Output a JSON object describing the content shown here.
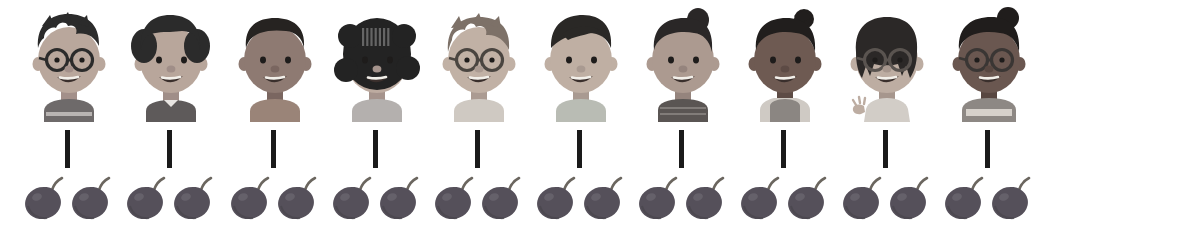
{
  "diagram": {
    "type": "pictorial-correspondence",
    "background_color": "#ffffff",
    "connector_color": "#1a1a1a",
    "groups_count": 10,
    "fruits_per_group": 2,
    "total_fruits": 20,
    "fruit_name": "plum",
    "fruit_color": "#55505a",
    "fruit_stem_color": "#6b665f",
    "columns": [
      {
        "index": 1,
        "x": 16,
        "child": {
          "name": "boy-with-glasses",
          "label": "Boy with round glasses",
          "skin": "#b9a79c",
          "skin_shadow": "#a3908a",
          "hair": "#2b2b2b",
          "hair_style": "spiky-short",
          "shirt": "#6e6a6a",
          "shirt_stripe": "#b8b4b2",
          "glasses": true,
          "glasses_color": "#2b2b2b",
          "accessory": "none"
        },
        "fruits": 2
      },
      {
        "index": 2,
        "x": 118,
        "child": {
          "name": "girl-with-pigtails",
          "label": "Girl with pigtails",
          "skin": "#b8a69b",
          "skin_shadow": "#a08e88",
          "hair": "#2b2b2b",
          "hair_style": "pigtails-bangs",
          "shirt": "#5e5a5a",
          "shirt_stripe": "#5e5a5a",
          "glasses": false,
          "glasses_color": "#2b2b2b",
          "accessory": "collar"
        },
        "fruits": 2
      },
      {
        "index": 3,
        "x": 222,
        "child": {
          "name": "boy-short-hair",
          "label": "Boy with short hair",
          "skin": "#8e7a72",
          "skin_shadow": "#7a6660",
          "hair": "#262321",
          "hair_style": "short-cropped",
          "shirt": "#9a8478",
          "shirt_stripe": "#9a8478",
          "glasses": false,
          "glasses_color": "#2b2b2b",
          "accessory": "none"
        },
        "fruits": 2
      },
      {
        "index": 4,
        "x": 324,
        "child": {
          "name": "girl-curly-bob",
          "label": "Girl with curly bob hair",
          "skin": "#bdaba0",
          "skin_shadow": "#a5938c",
          "hair": "#232323",
          "hair_style": "curly-bob-bangs",
          "shirt": "#b4b0ae",
          "shirt_stripe": "#b4b0ae",
          "glasses": false,
          "glasses_color": "#2b2b2b",
          "accessory": "none"
        },
        "fruits": 2
      },
      {
        "index": 5,
        "x": 426,
        "child": {
          "name": "boy-light-hair-glasses",
          "label": "Boy with light spiky hair and glasses",
          "skin": "#c1b1a5",
          "skin_shadow": "#ab9b92",
          "hair": "#7d7168",
          "hair_style": "spiky-light",
          "shirt": "#cfc9c2",
          "shirt_stripe": "#cfc9c2",
          "glasses": true,
          "glasses_color": "#4a4540",
          "accessory": "none"
        },
        "fruits": 2
      },
      {
        "index": 6,
        "x": 528,
        "child": {
          "name": "boy-side-swept-hair",
          "label": "Boy with side-swept dark hair",
          "skin": "#bfafa3",
          "skin_shadow": "#a99a91",
          "hair": "#2a2826",
          "hair_style": "side-swept",
          "shirt": "#b9bcb4",
          "shirt_stripe": "#b9bcb4",
          "glasses": false,
          "glasses_color": "#2b2b2b",
          "accessory": "none"
        },
        "fruits": 2
      },
      {
        "index": 7,
        "x": 630,
        "child": {
          "name": "girl-topknot",
          "label": "Girl with top knot",
          "skin": "#ac9a90",
          "skin_shadow": "#95847d",
          "hair": "#2a2727",
          "hair_style": "topknot-bangs",
          "shirt": "#5a5553",
          "shirt_stripe": "#8b8683",
          "glasses": false,
          "glasses_color": "#2b2b2b",
          "accessory": "knit-top"
        },
        "fruits": 2
      },
      {
        "index": 8,
        "x": 732,
        "child": {
          "name": "girl-bun-with-bow",
          "label": "Girl with bun and bow, pinafore dress",
          "skin": "#6e5a52",
          "skin_shadow": "#5d4b45",
          "hair": "#211e1d",
          "hair_style": "bun-bow",
          "shirt": "#8b8682",
          "shirt_stripe": "#cfcac4",
          "glasses": false,
          "glasses_color": "#2b2b2b",
          "accessory": "pinafore"
        },
        "fruits": 2
      },
      {
        "index": 9,
        "x": 834,
        "child": {
          "name": "girl-waving-with-glasses",
          "label": "Girl with glasses waving",
          "skin": "#bdada2",
          "skin_shadow": "#a6968d",
          "hair": "#2b2827",
          "hair_style": "bob-layered",
          "shirt": "#d2cdc7",
          "shirt_stripe": "#d2cdc7",
          "glasses": true,
          "glasses_color": "#5a5450",
          "accessory": "waving-hand"
        },
        "fruits": 2
      },
      {
        "index": 10,
        "x": 936,
        "child": {
          "name": "girl-bun-glasses-striped-shirt",
          "label": "Girl with bun, glasses and striped shirt",
          "skin": "#6a5750",
          "skin_shadow": "#584741",
          "hair": "#201d1c",
          "hair_style": "bun-top",
          "shirt": "#8d8884",
          "shirt_stripe": "#d6d1cb",
          "glasses": true,
          "glasses_color": "#3a3634",
          "accessory": "striped-shirt"
        },
        "fruits": 2
      }
    ]
  }
}
